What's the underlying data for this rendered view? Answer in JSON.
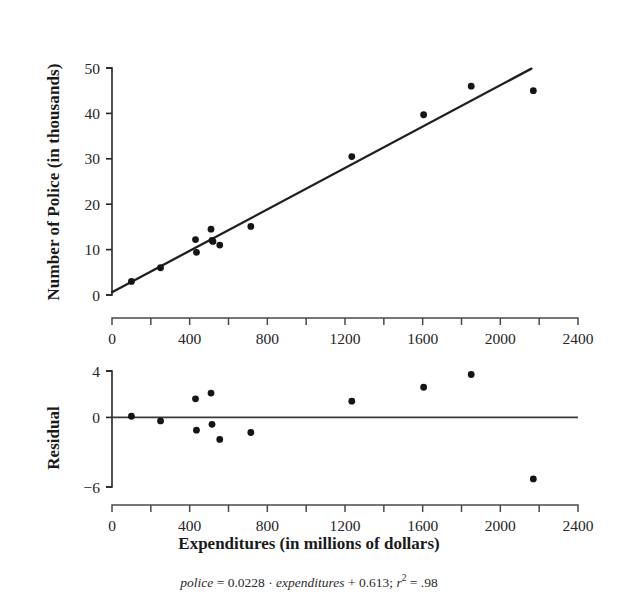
{
  "figure": {
    "caption": {
      "lhs": "police",
      "eq1": " = 0.0228 · ",
      "var": "expenditures",
      "eq2": " + 0.613; ",
      "rsym": "r",
      "rexp": "2",
      "eq3": " = .98"
    },
    "xlabel": "Expenditures (in millions of dollars)"
  },
  "chart_data": [
    {
      "type": "scatter",
      "title": "",
      "xlabel": "Expenditures (in millions of dollars)",
      "ylabel": "Number of Police (in thousands)",
      "xlim": [
        0,
        2400
      ],
      "ylim": [
        0,
        50
      ],
      "xticks": [
        0,
        400,
        800,
        1200,
        1600,
        2000,
        2400
      ],
      "xtick_labels": [
        "0",
        "400",
        "800",
        "1200",
        "1600",
        "2000",
        "2400"
      ],
      "xminor_ticks": [
        200,
        600,
        1000,
        1400,
        1800,
        2200
      ],
      "yticks": [
        0,
        10,
        20,
        30,
        40,
        50
      ],
      "ytick_labels": [
        "0",
        "10",
        "20",
        "30",
        "40",
        "50"
      ],
      "grid": false,
      "legend": "none",
      "x": [
        100,
        250,
        430,
        435,
        510,
        515,
        520,
        555,
        715,
        1235,
        1605,
        1850,
        2170
      ],
      "y": [
        3.0,
        6.0,
        12.2,
        9.4,
        14.5,
        12.0,
        11.8,
        11.0,
        15.1,
        30.5,
        39.7,
        46.0,
        45.0
      ],
      "fit_line": {
        "slope": 0.0228,
        "intercept": 0.613,
        "x_start": 0,
        "x_end": 2160,
        "r_squared": 0.98
      }
    },
    {
      "type": "scatter",
      "title": "",
      "xlabel": "Expenditures (in millions of dollars)",
      "ylabel": "Residual",
      "xlim": [
        0,
        2400
      ],
      "ylim": [
        -6,
        4
      ],
      "xticks": [
        0,
        400,
        800,
        1200,
        1600,
        2000,
        2400
      ],
      "xtick_labels": [
        "0",
        "400",
        "800",
        "1200",
        "1600",
        "2000",
        "2400"
      ],
      "xminor_ticks": [
        200,
        600,
        1000,
        1400,
        1800,
        2200
      ],
      "yticks": [
        4,
        0,
        -6
      ],
      "ytick_labels": [
        "4",
        "0",
        "−6"
      ],
      "grid": false,
      "legend": "none",
      "zero_line": 0,
      "x": [
        100,
        250,
        430,
        435,
        510,
        515,
        555,
        715,
        1235,
        1605,
        1850,
        2170
      ],
      "y": [
        0.1,
        -0.3,
        1.6,
        -1.1,
        2.1,
        -0.6,
        -1.9,
        -1.3,
        1.4,
        2.6,
        3.7,
        -5.3
      ]
    }
  ]
}
